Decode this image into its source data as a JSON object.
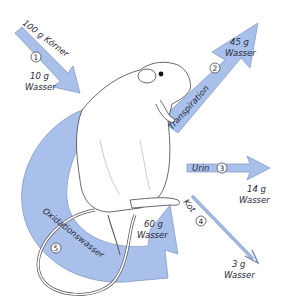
{
  "colors": {
    "arrow_fill": "#a9c1ea",
    "arrow_stroke": "#6f86b8",
    "text": "#2a2a3a",
    "mouse_outline": "#444444",
    "background": "#ffffff"
  },
  "flows": [
    {
      "id": 1,
      "number": "1",
      "label": "100 g Körner",
      "amount": "10 g",
      "unit": "Wasser",
      "direction": "in"
    },
    {
      "id": 2,
      "number": "2",
      "label": "Transpiration",
      "amount": "45 g",
      "unit": "Wasser",
      "direction": "out"
    },
    {
      "id": 3,
      "number": "3",
      "label": "Urin",
      "amount": "14 g",
      "unit": "Wasser",
      "direction": "out"
    },
    {
      "id": 4,
      "number": "4",
      "label": "Kot",
      "amount": "3 g",
      "unit": "Wasser",
      "direction": "out"
    },
    {
      "id": 5,
      "number": "5",
      "label": "Oxidationswasser",
      "amount": "60 g",
      "unit": "Wasser",
      "direction": "in"
    }
  ]
}
